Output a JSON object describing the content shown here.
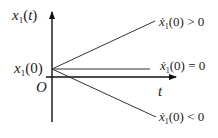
{
  "diagram": {
    "title": "",
    "y_axis_label": "x1(t)",
    "x_axis_label": "t",
    "origin_label": "O",
    "start_value_label": "x1(0)",
    "lines": [
      {
        "name": "positive-derivative",
        "label": "ẋ1(0) > 0",
        "condition": "> 0"
      },
      {
        "name": "zero-derivative",
        "label": "ẋ1(0) = 0",
        "condition": "= 0"
      },
      {
        "name": "negative-derivative",
        "label": "ẋ1(0) < 0",
        "condition": "< 0"
      }
    ],
    "colors": {
      "axis": "#111111",
      "line": "#333333",
      "text": "#222222"
    }
  }
}
